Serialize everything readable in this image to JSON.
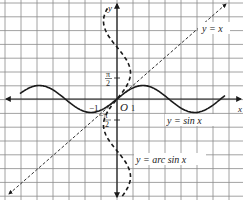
{
  "figure": {
    "title": "",
    "axes": {
      "x_label": "x",
      "y_label": "y",
      "origin_label": "O"
    },
    "tick_labels": {
      "x_neg_one": "−1",
      "x_one": "1",
      "y_pi_half_num": "π",
      "y_pi_half_den": "2",
      "y_neg_pi_half_num": "−π",
      "y_neg_pi_half_den": "2"
    },
    "curves": [
      {
        "name": "y-equals-x",
        "label": "y = x",
        "style": "dashed-thin"
      },
      {
        "name": "y-equals-sin-x",
        "label": "y = sin x",
        "style": "solid"
      },
      {
        "name": "y-equals-arcsin-x",
        "label": "y = arc sin x",
        "style": "dashed-thick"
      }
    ],
    "colors": {
      "grid": "#7a7a7a",
      "curve": "#1a1a1a",
      "background": "#ffffff"
    }
  }
}
